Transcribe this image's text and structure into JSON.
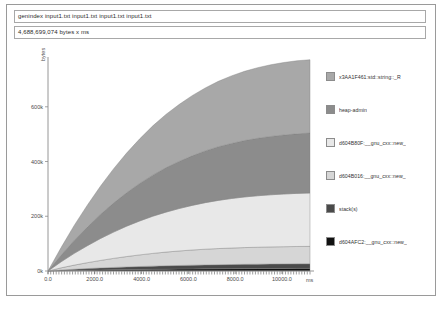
{
  "window": {
    "title": "genindex input1.txt input1.txt input1.txt input1.txt"
  },
  "header": {
    "command_field": {
      "value": "genindex input1.txt input1.txt input1.txt input1.txt",
      "placeholder": "command"
    },
    "total_field": {
      "value": "4,688,699,074 bytes x ms",
      "placeholder": "total"
    }
  },
  "chart_data": {
    "type": "area",
    "title": "",
    "subtitle": "",
    "xlabel": "ms",
    "ylabel": "bytes",
    "grid": false,
    "legend_position": "right",
    "xlim": [
      0.0,
      11200.0
    ],
    "ylim": [
      0,
      760000
    ],
    "x_ticks": [
      "0.0",
      "2000.0",
      "4000.0",
      "6000.0",
      "8000.0",
      "10000.0"
    ],
    "x_tick_values": [
      0.0,
      2000.0,
      4000.0,
      6000.0,
      8000.0,
      10000.0
    ],
    "y_ticks": [
      "0k",
      "200k",
      "400k",
      "600k"
    ],
    "y_tick_values": [
      0,
      200000,
      400000,
      600000
    ],
    "x": [
      0,
      560,
      1120,
      1680,
      2240,
      2800,
      3360,
      3920,
      4480,
      5040,
      5600,
      6160,
      6720,
      7280,
      7840,
      8400,
      8960,
      9520,
      10080,
      10640,
      11200
    ],
    "series": [
      {
        "name": "d604AFC2:__gnu_cxx::new_",
        "color": "#111111",
        "values": [
          0,
          1200,
          2200,
          3000,
          3800,
          4500,
          5100,
          5700,
          6200,
          6700,
          7100,
          7500,
          7900,
          8200,
          8500,
          8800,
          9000,
          9200,
          9400,
          9600,
          9700
        ]
      },
      {
        "name": "stack(s)",
        "color": "#4a4a4a",
        "values": [
          0,
          2400,
          4300,
          5900,
          7300,
          8600,
          9700,
          10700,
          11600,
          12400,
          13100,
          13700,
          14300,
          14800,
          15200,
          15600,
          15900,
          16200,
          16400,
          16600,
          16700
        ]
      },
      {
        "name": "d604B016:__gnu_cxx::new_",
        "color": "#d6d6d6",
        "values": [
          0,
          8000,
          15000,
          21500,
          27500,
          33000,
          38000,
          42500,
          46500,
          50000,
          53000,
          55500,
          57500,
          59000,
          60200,
          61200,
          62000,
          62600,
          63000,
          63400,
          63600
        ]
      },
      {
        "name": "d604B80F:__gnu_cxx::new_",
        "color": "#e8e8e8",
        "values": [
          0,
          22000,
          43000,
          62000,
          80000,
          96000,
          111000,
          124000,
          136000,
          146000,
          155000,
          163000,
          170000,
          176000,
          181000,
          185000,
          188000,
          190500,
          192500,
          194000,
          195000
        ]
      },
      {
        "name": "heap-admin",
        "color": "#8c8c8c",
        "values": [
          0,
          24000,
          47000,
          68000,
          88000,
          106000,
          122000,
          137000,
          150000,
          162000,
          172000,
          181000,
          189000,
          196000,
          201000,
          206000,
          210000,
          213000,
          215500,
          217500,
          219000
        ]
      },
      {
        "name": "x3AA1F461:std::string::_R",
        "color": "#a8a8a8",
        "values": [
          0,
          28000,
          55000,
          80000,
          103000,
          125000,
          145000,
          163000,
          180000,
          195000,
          208000,
          220000,
          230000,
          239000,
          247000,
          253000,
          258000,
          262000,
          265000,
          267000,
          268000
        ]
      }
    ],
    "legend": [
      {
        "label": "x3AA1F461:std::string::_R",
        "color": "#a8a8a8"
      },
      {
        "label": "heap-admin",
        "color": "#8c8c8c"
      },
      {
        "label": "d604B80F:__gnu_cxx::new_",
        "color": "#e8e8e8"
      },
      {
        "label": "d604B016:__gnu_cxx::new_",
        "color": "#d6d6d6"
      },
      {
        "label": "stack(s)",
        "color": "#4a4a4a"
      },
      {
        "label": "d604AFC2:__gnu_cxx::new_",
        "color": "#111111"
      }
    ]
  }
}
